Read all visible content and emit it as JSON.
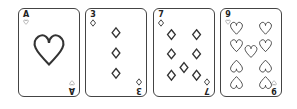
{
  "hand": {
    "cards": [
      {
        "rank": "A",
        "suit": "hearts"
      },
      {
        "rank": "3",
        "suit": "diamonds"
      },
      {
        "rank": "7",
        "suit": "diamonds"
      },
      {
        "rank": "9",
        "suit": "hearts"
      }
    ]
  },
  "colors": {
    "ink": "#333333",
    "card_bg": "#ffffff",
    "border": "#444444"
  }
}
